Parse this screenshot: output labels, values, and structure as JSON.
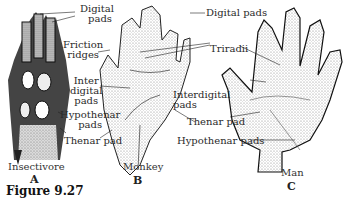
{
  "figure": {
    "number_label": "Figure  9.27",
    "panels": [
      {
        "letter": "A",
        "caption": "Insectivore",
        "labels": [
          "Digital pads",
          "Friction ridges",
          "Inter digital pads",
          "Hypothenar pads",
          "Thenar pad"
        ]
      },
      {
        "letter": "B",
        "caption": "Monkey",
        "labels": [
          "Triradii",
          "Interdigital pads"
        ]
      },
      {
        "letter": "C",
        "caption": "Man",
        "labels": [
          "Digital pads",
          "Thenar pad",
          "Hypothenar pads"
        ]
      }
    ]
  },
  "labels": {
    "digital_left_1": "Digital",
    "digital_left_2": "pads",
    "friction_1": "Friction",
    "friction_2": "ridges",
    "inter_1": "Inter",
    "inter_2": "digital",
    "inter_3": "pads",
    "hypo_left_1": "Hypothenar",
    "hypo_left_2": "pads",
    "thenar_left": "Thenar pad",
    "digital_right": "Digital pads",
    "triradii": "Triradii",
    "interdigital_1": "Interdigital",
    "interdigital_2": "pads",
    "thenar_right": "Thenar pad",
    "hypo_right": "Hypothenar pads"
  },
  "colors": {
    "ink": "#222222",
    "stipple": "#9a9a9a",
    "background": "#ffffff"
  }
}
